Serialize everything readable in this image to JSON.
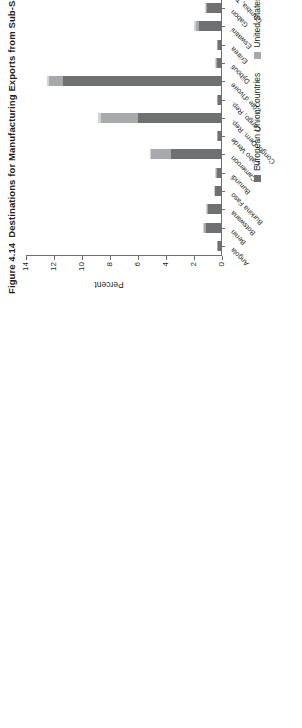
{
  "figure": {
    "number": "Figure 4.14",
    "title": "Destinations for Manufacturing Exports from Sub-Saharan Africa, 2015"
  },
  "legend": {
    "items": [
      {
        "label": "European Union countries",
        "color": "#6f7072",
        "key": "eu"
      },
      {
        "label": "United States",
        "color": "#a7a9ac",
        "key": "us"
      },
      {
        "label": "China",
        "color": "#d2d3d5",
        "key": "cn"
      }
    ]
  },
  "chart_data": {
    "type": "bar",
    "orientation": "vertical-stacked",
    "title": "Destinations for Manufacturing Exports from Sub-Saharan Africa, 2015",
    "xlabel": "",
    "ylabel": "Percent",
    "ylim": [
      0,
      14
    ],
    "yticks": [
      0,
      2,
      4,
      6,
      8,
      10,
      12,
      14
    ],
    "grid": false,
    "legend_position": "bottom",
    "categories": [
      "Angola",
      "Benin",
      "Botswana",
      "Burkina Faso",
      "Burundi",
      "Cameroon",
      "Cabo Verde",
      "Congo, Dem. Rep.",
      "Congo, Rep.",
      "Côte d'Ivoire",
      "Djibouti",
      "Eritrea",
      "Eswatini",
      "Gabon",
      "Gambia, The",
      "Ghana",
      "Guinea",
      "Kenya",
      "Lesotho",
      "Liberia",
      "Madagascar",
      "Malawi",
      "Mali",
      "Mauritania",
      "Mauritius",
      "Mozambique",
      "Namibia",
      "Niger",
      "Nigeria",
      "Senegal",
      "Sierra Leone",
      "Tanzania",
      "Togo",
      "Uganda",
      "Zambia"
    ],
    "series": [
      {
        "name": "European Union countries",
        "color": "#6f7072",
        "values": [
          0.2,
          1.1,
          0.9,
          0.4,
          0.3,
          3.6,
          0.2,
          5.9,
          0.2,
          11.3,
          0.3,
          0.2,
          1.6,
          1.0,
          0.9,
          5.6,
          0.6,
          2.1,
          0.3,
          11.9,
          4.4,
          1.2,
          0.4,
          6.0,
          5.2,
          7.4,
          1.0,
          5.6,
          2.4,
          7.4,
          2.1,
          2.3,
          1.5,
          0.5,
          4.7
        ]
      },
      {
        "name": "United States",
        "color": "#a7a9ac",
        "values": [
          0.05,
          0.1,
          0.1,
          0.05,
          0.05,
          1.4,
          0.05,
          2.7,
          0.05,
          1.0,
          0.05,
          0.05,
          0.2,
          0.1,
          0.1,
          2.6,
          0.1,
          0.5,
          0.05,
          0.2,
          0.7,
          0.1,
          0.05,
          1.2,
          0.4,
          0.5,
          0.1,
          0.3,
          1.4,
          0.5,
          0.7,
          0.4,
          0.1,
          0.1,
          0.6
        ]
      },
      {
        "name": "China",
        "color": "#d2d3d5",
        "values": [
          0.05,
          0.05,
          0.05,
          0.05,
          0.05,
          0.1,
          0.05,
          0.2,
          0.05,
          0.1,
          0.05,
          0.05,
          0.1,
          0.05,
          0.05,
          0.1,
          0.05,
          0.1,
          0.05,
          0.1,
          0.1,
          0.05,
          0.05,
          0.1,
          0.1,
          0.2,
          0.05,
          0.1,
          0.1,
          0.2,
          0.1,
          0.1,
          0.05,
          0.05,
          6.2
        ]
      }
    ]
  }
}
